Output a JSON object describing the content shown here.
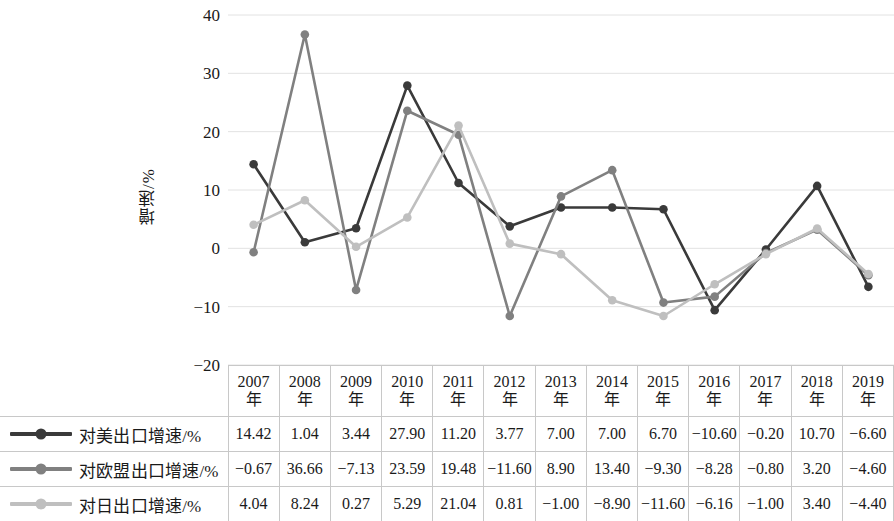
{
  "chart_data": {
    "type": "line",
    "title": "",
    "xlabel": "",
    "ylabel": "增速/%",
    "ylim": [
      -20,
      40
    ],
    "yticks": [
      40,
      30,
      20,
      10,
      0,
      -10,
      -20
    ],
    "ytick_labels": [
      "40",
      "30",
      "20",
      "10",
      "0",
      "−10",
      "−20"
    ],
    "grid": true,
    "legend_position": "table-left",
    "categories": [
      "2007年",
      "2008年",
      "2009年",
      "2010年",
      "2011年",
      "2012年",
      "2013年",
      "2014年",
      "2015年",
      "2016年",
      "2017年",
      "2018年",
      "2019年"
    ],
    "series": [
      {
        "name": "对美出口增速/%",
        "color": "#3a3a3a",
        "values": [
          14.42,
          1.04,
          3.44,
          27.9,
          11.2,
          3.77,
          7.0,
          7.0,
          6.7,
          -10.6,
          -0.2,
          10.7,
          -6.6
        ],
        "labels": [
          "14.42",
          "1.04",
          "3.44",
          "27.90",
          "11.20",
          "3.77",
          "7.00",
          "7.00",
          "6.70",
          "−10.60",
          "−0.20",
          "10.70",
          "−6.60"
        ]
      },
      {
        "name": "对欧盟出口增速/%",
        "color": "#808080",
        "values": [
          -0.67,
          36.66,
          -7.13,
          23.59,
          19.48,
          -11.6,
          8.9,
          13.4,
          -9.3,
          -8.28,
          -0.8,
          3.2,
          -4.6
        ],
        "labels": [
          "−0.67",
          "36.66",
          "−7.13",
          "23.59",
          "19.48",
          "−11.60",
          "8.90",
          "13.40",
          "−9.30",
          "−8.28",
          "−0.80",
          "3.20",
          "−4.60"
        ]
      },
      {
        "name": "对日出口增速/%",
        "color": "#bfbfbf",
        "values": [
          4.04,
          8.24,
          0.27,
          5.29,
          21.04,
          0.81,
          -1.0,
          -8.9,
          -11.6,
          -6.16,
          -1.0,
          3.4,
          -4.4
        ],
        "labels": [
          "4.04",
          "8.24",
          "0.27",
          "5.29",
          "21.04",
          "0.81",
          "−1.00",
          "−8.90",
          "−11.60",
          "−6.16",
          "−1.00",
          "3.40",
          "−4.40"
        ]
      }
    ]
  },
  "style": {
    "grid_color": "#e2e2e2",
    "border_color": "#c8c8c8",
    "text_color": "#1a1a1a"
  }
}
